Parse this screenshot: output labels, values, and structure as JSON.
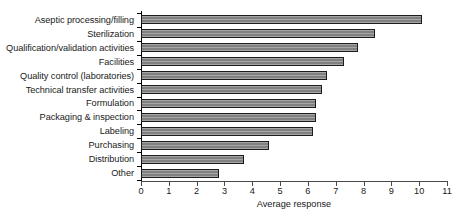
{
  "chart_data": {
    "type": "bar",
    "orientation": "horizontal",
    "title": "",
    "xlabel": "Average response",
    "ylabel": "",
    "xlim": [
      0,
      11
    ],
    "xticks": [
      0,
      1,
      2,
      3,
      4,
      5,
      6,
      7,
      8,
      9,
      10,
      11
    ],
    "grid": false,
    "legend": null,
    "bar_color": "#808080",
    "bar_edge_color": "#1c1c1c",
    "categories": [
      "Aseptic processing/filling",
      "Sterilization",
      "Qualification/validation activities",
      "Facilities",
      "Quality control (laboratories)",
      "Technical transfer activities",
      "Formulation",
      "Packaging & inspection",
      "Labeling",
      "Purchasing",
      "Distribution",
      "Other"
    ],
    "values": [
      10.1,
      8.4,
      7.8,
      7.3,
      6.7,
      6.5,
      6.3,
      6.3,
      6.2,
      4.6,
      3.7,
      2.8
    ]
  }
}
